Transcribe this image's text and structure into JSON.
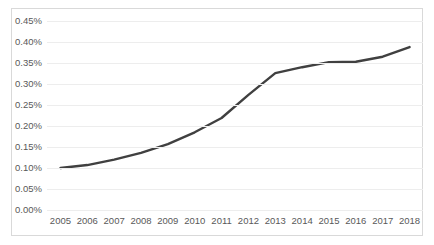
{
  "chart_data": {
    "type": "line",
    "title": "",
    "subtitle": "",
    "xlabel": "",
    "ylabel": "",
    "categories": [
      "2005",
      "2006",
      "2007",
      "2008",
      "2009",
      "2010",
      "2011",
      "2012",
      "2013",
      "2014",
      "2015",
      "2016",
      "2017",
      "2018"
    ],
    "series": [
      {
        "name": "",
        "values": [
          0.1,
          0.107,
          0.12,
          0.136,
          0.157,
          0.185,
          0.219,
          0.274,
          0.326,
          0.34,
          0.352,
          0.353,
          0.365,
          0.388
        ],
        "color": "#404040"
      }
    ],
    "ylim": [
      0.0,
      0.45
    ],
    "yticks": [
      0.0,
      0.05,
      0.1,
      0.15,
      0.2,
      0.25,
      0.3,
      0.35,
      0.4,
      0.45
    ],
    "ytick_labels": [
      "0.00%",
      "0.05%",
      "0.10%",
      "0.15%",
      "0.20%",
      "0.25%",
      "0.30%",
      "0.35%",
      "0.40%",
      "0.45%"
    ],
    "grid": true,
    "grid_color": "#ededed",
    "legend": false,
    "legend_position": "none",
    "border_color": "#d9d9d9",
    "background": "#ffffff",
    "markers": false,
    "line_width": 2.4
  }
}
